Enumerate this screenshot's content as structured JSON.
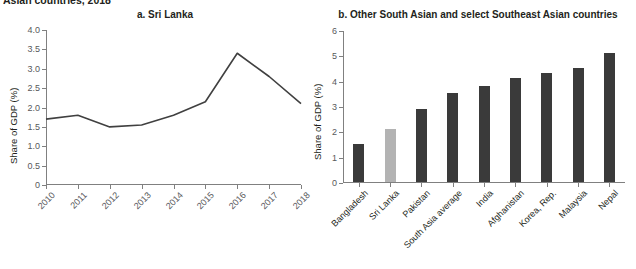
{
  "figure": {
    "title": "Asian countries, 2018"
  },
  "panel_a": {
    "title": "a. Sri Lanka",
    "ylabel": "Share of GDP (%)",
    "yticks": [
      "0",
      "0.5",
      "1.0",
      "1.5",
      "2.0",
      "2.5",
      "3.0",
      "3.5",
      "4.0"
    ],
    "xticks": [
      "2010",
      "2011",
      "2012",
      "2013",
      "2014",
      "2015",
      "2016",
      "2017",
      "2018"
    ]
  },
  "panel_b": {
    "title": "b. Other South Asian and select Southeast Asian countries",
    "ylabel": "Share of GDP (%)",
    "yticks": [
      "0",
      "1",
      "2",
      "3",
      "4",
      "5",
      "6"
    ],
    "xticks": [
      "Bangladesh",
      "Sri Lanka",
      "Pakistan",
      "South Asia average",
      "India",
      "Afghanistan",
      "Korea, Rep.",
      "Malaysia",
      "Nepal"
    ]
  },
  "colors": {
    "bar_default": "#3a3a3a",
    "bar_highlight": "#b3b3b3",
    "line": "#404040",
    "axis": "#808080",
    "text": "#231f20",
    "tick_text": "#58595b"
  },
  "chart_data": [
    {
      "type": "line",
      "title": "a. Sri Lanka",
      "xlabel": "",
      "ylabel": "Share of GDP (%)",
      "x": [
        "2010",
        "2011",
        "2012",
        "2013",
        "2014",
        "2015",
        "2016",
        "2017",
        "2018"
      ],
      "values": [
        1.7,
        1.8,
        1.5,
        1.55,
        1.8,
        2.15,
        3.4,
        2.8,
        2.1
      ],
      "ylim": [
        0,
        4.0
      ],
      "ytick_step": 0.5,
      "grid": false,
      "legend": "none",
      "series_color": "#404040"
    },
    {
      "type": "bar",
      "title": "b. Other South Asian and select Southeast Asian countries",
      "xlabel": "",
      "ylabel": "Share of GDP (%)",
      "categories": [
        "Bangladesh",
        "Sri Lanka",
        "Pakistan",
        "South Asia average",
        "India",
        "Afghanistan",
        "Korea, Rep.",
        "Malaysia",
        "Nepal"
      ],
      "values": [
        1.5,
        2.1,
        2.9,
        3.5,
        3.8,
        4.1,
        4.3,
        4.5,
        5.1
      ],
      "bar_colors": [
        "#3a3a3a",
        "#b3b3b3",
        "#3a3a3a",
        "#3a3a3a",
        "#3a3a3a",
        "#3a3a3a",
        "#3a3a3a",
        "#3a3a3a",
        "#3a3a3a"
      ],
      "ylim": [
        0,
        6
      ],
      "ytick_step": 1,
      "grid": false,
      "legend": "none"
    }
  ]
}
